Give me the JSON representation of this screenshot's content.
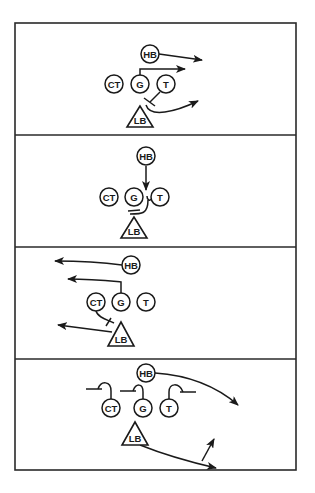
{
  "diagram": {
    "type": "football-blocking-scheme",
    "panels": [
      {
        "index": 1,
        "players": [
          {
            "id": "HB",
            "label": "HB",
            "shape": "circle"
          },
          {
            "id": "CT",
            "label": "CT",
            "shape": "circle"
          },
          {
            "id": "G",
            "label": "G",
            "shape": "circle"
          },
          {
            "id": "T",
            "label": "T",
            "shape": "circle"
          },
          {
            "id": "LB",
            "label": "LB",
            "shape": "triangle"
          }
        ],
        "routes": [
          "HB arrow right",
          "G pull arrow right",
          "T block on LB",
          "LB arrow right"
        ]
      },
      {
        "index": 2,
        "players": [
          {
            "id": "HB",
            "label": "HB",
            "shape": "circle"
          },
          {
            "id": "CT",
            "label": "CT",
            "shape": "circle"
          },
          {
            "id": "G",
            "label": "G",
            "shape": "circle"
          },
          {
            "id": "T",
            "label": "T",
            "shape": "circle"
          },
          {
            "id": "LB",
            "label": "LB",
            "shape": "triangle"
          }
        ],
        "routes": [
          "HB arrow down into G-T gap",
          "T down block"
        ]
      },
      {
        "index": 3,
        "players": [
          {
            "id": "HB",
            "label": "HB",
            "shape": "circle"
          },
          {
            "id": "CT",
            "label": "CT",
            "shape": "circle"
          },
          {
            "id": "G",
            "label": "G",
            "shape": "circle"
          },
          {
            "id": "T",
            "label": "T",
            "shape": "circle"
          },
          {
            "id": "LB",
            "label": "LB",
            "shape": "triangle"
          }
        ],
        "routes": [
          "HB arrow left",
          "G pull arrow left",
          "CT block on LB",
          "LB arrow left"
        ]
      },
      {
        "index": 4,
        "players": [
          {
            "id": "HB",
            "label": "HB",
            "shape": "circle"
          },
          {
            "id": "CT",
            "label": "CT",
            "shape": "circle"
          },
          {
            "id": "G",
            "label": "G",
            "shape": "circle"
          },
          {
            "id": "T",
            "label": "T",
            "shape": "circle"
          },
          {
            "id": "LB",
            "label": "LB",
            "shape": "triangle"
          }
        ],
        "routes": [
          "CT hook block left",
          "G hook block left",
          "T hook block right",
          "HB arc arrow right",
          "LB arrow right with upfield branch"
        ]
      }
    ]
  },
  "colors": {
    "ink": "#1a1a1a",
    "frame": "#2a2a2a",
    "background": "#ffffff"
  }
}
